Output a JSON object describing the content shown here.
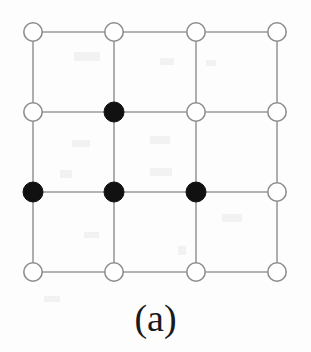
{
  "figure": {
    "caption": "(a)",
    "type": "square-lattice-graph",
    "canvas": {
      "width": 311,
      "height": 352,
      "background_color": "#fdfdfd"
    },
    "style": {
      "edge_color": "#9a9a9a",
      "edge_width": 1.6,
      "node_radius": 10,
      "open_node_fill": "#ffffff",
      "open_node_stroke": "#8d8d8d",
      "open_node_stroke_width": 1.6,
      "filled_node_fill": "#111111",
      "filled_node_stroke": "#111111",
      "caption_color": "#1a1a1a"
    },
    "grid": {
      "rows": 4,
      "cols": 4,
      "column_x": [
        33,
        114,
        196,
        277
      ],
      "row_y": [
        32,
        112,
        192,
        272
      ]
    },
    "nodes": [
      {
        "id": "n-r1c1",
        "row": 1,
        "col": 1,
        "cx": 33,
        "cy": 32,
        "state": "open"
      },
      {
        "id": "n-r1c2",
        "row": 1,
        "col": 2,
        "cx": 114,
        "cy": 32,
        "state": "open"
      },
      {
        "id": "n-r1c3",
        "row": 1,
        "col": 3,
        "cx": 196,
        "cy": 32,
        "state": "open"
      },
      {
        "id": "n-r1c4",
        "row": 1,
        "col": 4,
        "cx": 277,
        "cy": 32,
        "state": "open"
      },
      {
        "id": "n-r2c1",
        "row": 2,
        "col": 1,
        "cx": 33,
        "cy": 112,
        "state": "open"
      },
      {
        "id": "n-r2c2",
        "row": 2,
        "col": 2,
        "cx": 114,
        "cy": 112,
        "state": "filled"
      },
      {
        "id": "n-r2c3",
        "row": 2,
        "col": 3,
        "cx": 196,
        "cy": 112,
        "state": "open"
      },
      {
        "id": "n-r2c4",
        "row": 2,
        "col": 4,
        "cx": 277,
        "cy": 112,
        "state": "open"
      },
      {
        "id": "n-r3c1",
        "row": 3,
        "col": 1,
        "cx": 33,
        "cy": 192,
        "state": "filled"
      },
      {
        "id": "n-r3c2",
        "row": 3,
        "col": 2,
        "cx": 114,
        "cy": 192,
        "state": "filled"
      },
      {
        "id": "n-r3c3",
        "row": 3,
        "col": 3,
        "cx": 196,
        "cy": 192,
        "state": "filled"
      },
      {
        "id": "n-r3c4",
        "row": 3,
        "col": 4,
        "cx": 277,
        "cy": 192,
        "state": "open"
      },
      {
        "id": "n-r4c1",
        "row": 4,
        "col": 1,
        "cx": 33,
        "cy": 272,
        "state": "open"
      },
      {
        "id": "n-r4c2",
        "row": 4,
        "col": 2,
        "cx": 114,
        "cy": 272,
        "state": "open"
      },
      {
        "id": "n-r4c3",
        "row": 4,
        "col": 3,
        "cx": 196,
        "cy": 272,
        "state": "open"
      },
      {
        "id": "n-r4c4",
        "row": 4,
        "col": 4,
        "cx": 277,
        "cy": 272,
        "state": "open"
      }
    ],
    "edges": [
      {
        "x1": 33,
        "y1": 32,
        "x2": 277,
        "y2": 32
      },
      {
        "x1": 33,
        "y1": 112,
        "x2": 277,
        "y2": 112
      },
      {
        "x1": 33,
        "y1": 192,
        "x2": 277,
        "y2": 192
      },
      {
        "x1": 33,
        "y1": 272,
        "x2": 277,
        "y2": 272
      },
      {
        "x1": 33,
        "y1": 32,
        "x2": 33,
        "y2": 272
      },
      {
        "x1": 114,
        "y1": 32,
        "x2": 114,
        "y2": 272
      },
      {
        "x1": 196,
        "y1": 32,
        "x2": 196,
        "y2": 272
      },
      {
        "x1": 277,
        "y1": 32,
        "x2": 277,
        "y2": 272
      }
    ],
    "flecks": [
      {
        "x": 74,
        "y": 52,
        "w": 26,
        "h": 9
      },
      {
        "x": 160,
        "y": 58,
        "w": 14,
        "h": 7
      },
      {
        "x": 206,
        "y": 60,
        "w": 10,
        "h": 6
      },
      {
        "x": 72,
        "y": 140,
        "w": 18,
        "h": 7
      },
      {
        "x": 150,
        "y": 136,
        "w": 20,
        "h": 8
      },
      {
        "x": 60,
        "y": 170,
        "w": 12,
        "h": 8
      },
      {
        "x": 150,
        "y": 168,
        "w": 22,
        "h": 8
      },
      {
        "x": 84,
        "y": 232,
        "w": 15,
        "h": 6
      },
      {
        "x": 222,
        "y": 214,
        "w": 20,
        "h": 8
      },
      {
        "x": 178,
        "y": 246,
        "w": 8,
        "h": 9
      },
      {
        "x": 44,
        "y": 296,
        "w": 16,
        "h": 6
      }
    ]
  }
}
